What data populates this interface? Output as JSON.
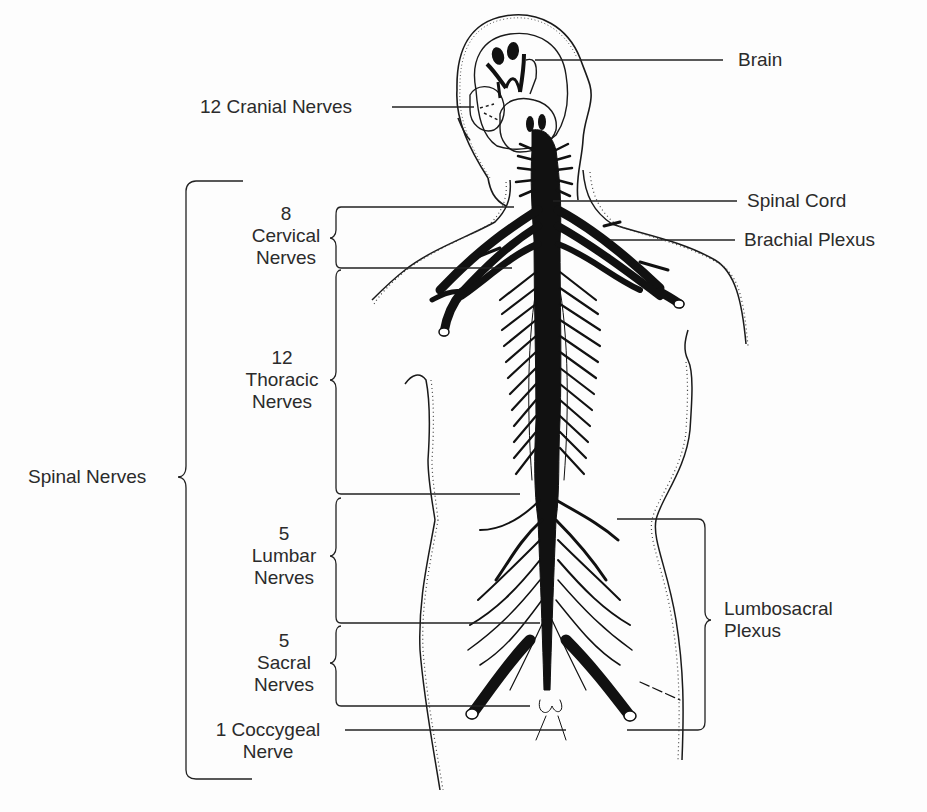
{
  "diagram": {
    "type": "anatomical-illustration",
    "colors": {
      "ink": "#141414",
      "label_text": "#2b2b2b",
      "background": "#fdfdfd"
    }
  },
  "labels": {
    "brain": "Brain",
    "cranial_nerves": "12 Cranial Nerves",
    "spinal_cord": "Spinal Cord",
    "brachial_plexus": "Brachial Plexus",
    "spinal_nerves": "Spinal Nerves",
    "lumbosacral_plexus": {
      "line1": "Lumbosacral",
      "line2": "Plexus"
    },
    "cervical": {
      "count": "8",
      "name": "Cervical",
      "suffix": "Nerves"
    },
    "thoracic": {
      "count": "12",
      "name": "Thoracic",
      "suffix": "Nerves"
    },
    "lumbar": {
      "count": "5",
      "name": "Lumbar",
      "suffix": "Nerves"
    },
    "sacral": {
      "count": "5",
      "name": "Sacral",
      "suffix": "Nerves"
    },
    "coccygeal": {
      "line1": "1 Coccygeal",
      "line2": "Nerve"
    }
  }
}
